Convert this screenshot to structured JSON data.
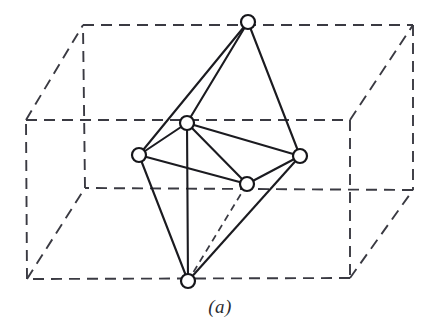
{
  "figure": {
    "caption": "(a)",
    "canvas": {
      "width": 440,
      "height": 334
    },
    "colors": {
      "background": "#ffffff",
      "solid_edge": "#1b1b20",
      "dashed_edge": "#3a3a42",
      "vertex_fill": "#ffffff",
      "vertex_stroke": "#16161a",
      "caption_text": "#2b2b30"
    },
    "box": {
      "style": "dashed",
      "dash_pattern": "11 7",
      "corners": {
        "front_top_left": {
          "x": 26,
          "y": 120
        },
        "front_top_right": {
          "x": 350,
          "y": 120
        },
        "front_bottom_right": {
          "x": 350,
          "y": 278
        },
        "front_bottom_left": {
          "x": 27,
          "y": 279
        },
        "back_top_left": {
          "x": 83,
          "y": 25
        },
        "back_top_right": {
          "x": 413,
          "y": 25
        },
        "back_bottom_right": {
          "x": 413,
          "y": 190
        },
        "back_bottom_left": {
          "x": 85,
          "y": 188
        }
      },
      "edges": [
        [
          "front_top_left",
          "front_top_right"
        ],
        [
          "front_top_right",
          "front_bottom_right"
        ],
        [
          "front_bottom_right",
          "front_bottom_left"
        ],
        [
          "front_bottom_left",
          "front_top_left"
        ],
        [
          "back_top_left",
          "back_top_right"
        ],
        [
          "back_top_right",
          "back_bottom_right"
        ],
        [
          "back_bottom_right",
          "back_bottom_left"
        ],
        [
          "back_bottom_left",
          "back_top_left"
        ],
        [
          "front_top_left",
          "back_top_left"
        ],
        [
          "front_top_right",
          "back_top_right"
        ],
        [
          "front_bottom_right",
          "back_bottom_right"
        ],
        [
          "front_bottom_left",
          "back_bottom_left"
        ]
      ]
    },
    "polyhedron": {
      "name": "octahedron",
      "vertex_count": 6,
      "vertex_radius": 7,
      "vertices": [
        {
          "id": "apex_top",
          "label": "top apex",
          "x": 248,
          "y": 22
        },
        {
          "id": "equat_back",
          "label": "upper equatorial",
          "x": 187,
          "y": 123
        },
        {
          "id": "equat_left",
          "label": "left equatorial",
          "x": 139,
          "y": 155
        },
        {
          "id": "equat_right",
          "label": "right equatorial",
          "x": 300,
          "y": 156
        },
        {
          "id": "equat_front",
          "label": "lower equatorial",
          "x": 247,
          "y": 184
        },
        {
          "id": "apex_bottom",
          "label": "bottom apex",
          "x": 188,
          "y": 281
        }
      ],
      "solid_edges": [
        [
          "apex_top",
          "equat_back"
        ],
        [
          "apex_top",
          "equat_left"
        ],
        [
          "apex_top",
          "equat_right"
        ],
        [
          "equat_back",
          "equat_left"
        ],
        [
          "equat_back",
          "equat_right"
        ],
        [
          "equat_back",
          "equat_front"
        ],
        [
          "equat_left",
          "equat_front"
        ],
        [
          "equat_right",
          "equat_front"
        ],
        [
          "equat_left",
          "apex_bottom"
        ],
        [
          "equat_right",
          "apex_bottom"
        ],
        [
          "equat_back",
          "apex_bottom"
        ]
      ],
      "hidden_edges": [
        [
          "equat_front",
          "apex_bottom"
        ]
      ]
    }
  }
}
